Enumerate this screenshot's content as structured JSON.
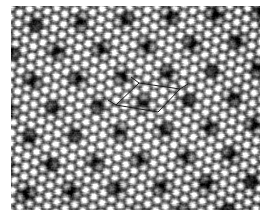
{
  "figure": {
    "domain_label": "scanning-probe-micrograph",
    "title": "",
    "caption": "",
    "background_color": "#ffffff",
    "image_region": {
      "x": 11,
      "y": 6,
      "width": 249,
      "height": 204
    }
  },
  "micrograph": {
    "name": "atomic-resolution-surface-image",
    "modality": "grayscale-height-map",
    "colormap": "grayscale",
    "min_gray": "#101010",
    "max_gray": "#ffffff",
    "mean_gray": "#9a9a9a",
    "noise_amplitude": 0.16,
    "scanline_artifact": true,
    "scanline_strength": 0.07,
    "atomic_lattice": {
      "description": "hexagonal close-packed bright protrusions",
      "spacing_px": 10.4,
      "angle_deg": 8,
      "amplitude": 0.62
    },
    "superlattice": {
      "description": "triangular array of dark depressions (moire / charge-density-wave maxima)",
      "a1_px": [
        45.0,
        -2.5
      ],
      "a2_px": [
        21.0,
        27.0
      ],
      "origin_px": [
        24,
        18
      ],
      "spot_radius_px": 7.5,
      "depth": 0.75,
      "rows": 9,
      "cols": 8
    }
  },
  "overlay": {
    "name": "unit-cell-marker",
    "shape": "parallelogram",
    "stroke_color": "#1a1a1a",
    "stroke_width_px": 1.0,
    "vertices_px": [
      [
        139,
        83
      ],
      [
        180,
        89
      ],
      [
        158,
        112
      ],
      [
        116,
        105
      ]
    ],
    "vertex_labels": [
      "top",
      "right",
      "bottom",
      "left"
    ],
    "edge_lengths_px": [
      41.4,
      32.0,
      42.6,
      29.2
    ],
    "ticks": {
      "enabled": true,
      "length_px": 7,
      "segments": [
        [
          [
            139,
            83
          ],
          [
            131,
            77
          ]
        ],
        [
          [
            180,
            89
          ],
          [
            188,
            84
          ]
        ],
        [
          [
            116,
            105
          ],
          [
            108,
            100
          ]
        ]
      ]
    }
  }
}
